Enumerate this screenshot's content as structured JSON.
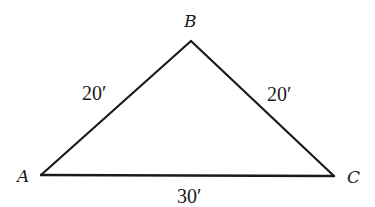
{
  "diagram": {
    "type": "triangle",
    "shape": "isosceles",
    "stroke_color": "#1a1a1a",
    "background": "#ffffff",
    "vertices": [
      {
        "id": "A",
        "label": "A",
        "x": 41,
        "y": 175
      },
      {
        "id": "B",
        "label": "B",
        "x": 191,
        "y": 41
      },
      {
        "id": "C",
        "label": "C",
        "x": 334,
        "y": 176
      }
    ],
    "sides": [
      {
        "from": "A",
        "to": "B",
        "length_label": "20′"
      },
      {
        "from": "B",
        "to": "C",
        "length_label": "20′"
      },
      {
        "from": "A",
        "to": "C",
        "length_label": "30′"
      }
    ]
  },
  "labels": {
    "vertex_a": "A",
    "vertex_b": "B",
    "vertex_c": "C",
    "side_ab": "20′",
    "side_bc": "20′",
    "side_ac": "30′"
  }
}
